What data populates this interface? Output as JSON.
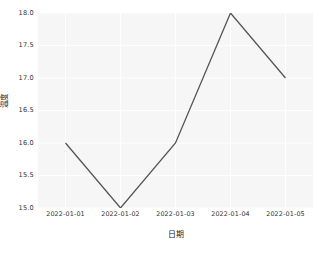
{
  "chart_data": {
    "type": "line",
    "title": "",
    "xlabel": "日期",
    "ylabel": "温度",
    "x": [
      "2022-01-01",
      "2022-01-02",
      "2022-01-03",
      "2022-01-04",
      "2022-01-05"
    ],
    "values": [
      16.0,
      15.0,
      16.0,
      18.0,
      17.0
    ],
    "series": [
      {
        "name": "",
        "values": [
          16.0,
          15.0,
          16.0,
          18.0,
          17.0
        ]
      }
    ],
    "ylim": [
      15.0,
      18.0
    ],
    "yticks": [
      "15.0",
      "15.5",
      "16.0",
      "16.5",
      "17.0",
      "17.5",
      "18.0"
    ],
    "ytick_values": [
      15.0,
      15.5,
      16.0,
      16.5,
      17.0,
      17.5,
      18.0
    ],
    "xticks": [
      "2022-01-01",
      "2022-01-02",
      "2022-01-03",
      "2022-01-04",
      "2022-01-05"
    ],
    "grid": true,
    "legend": false,
    "legend_position": "none",
    "style": {
      "line_color": "#555555",
      "line_width": 1.3,
      "plot_background": "#f6f6f6",
      "grid_color": "#ffffff",
      "figure_background": "#ffffff",
      "tick_label_color": "#333333"
    }
  }
}
